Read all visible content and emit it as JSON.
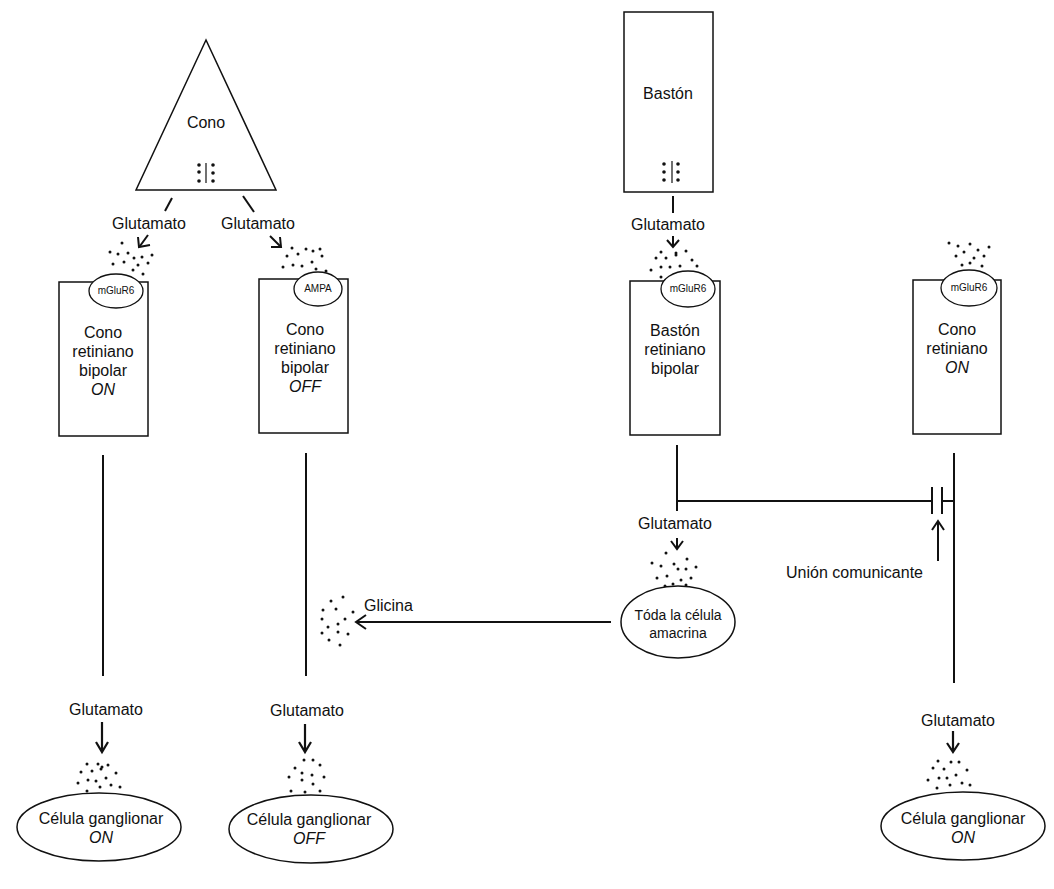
{
  "photoreceptors": {
    "cone": {
      "label": "Cono"
    },
    "rod": {
      "label": "Bastón"
    }
  },
  "neurotransmitters": {
    "glutamate": "Glutamato",
    "glycine": "Glicina"
  },
  "bipolar_cells": [
    {
      "receptor": "mGluR6",
      "line1": "Cono",
      "line2": "retiniano",
      "line3": "bipolar",
      "type": "ON"
    },
    {
      "receptor": "AMPA",
      "line1": "Cono",
      "line2": "retiniano",
      "line3": "bipolar",
      "type": "OFF"
    },
    {
      "receptor": "mGluR6",
      "line1": "Bastón",
      "line2": "retiniano",
      "line3": "bipolar",
      "type": ""
    },
    {
      "receptor": "mGluR6",
      "line1": "Cono",
      "line2": "retiniano",
      "line3": "",
      "type": "ON"
    }
  ],
  "amacrine": {
    "line1": "Tóda la célula",
    "line2": "amacrina"
  },
  "gap_junction": {
    "label": "Unión comunicante"
  },
  "ganglion_cells": [
    {
      "line1": "Célula ganglionar",
      "type": "ON"
    },
    {
      "line1": "Célula ganglionar",
      "type": "OFF"
    },
    {
      "line1": "Célula ganglionar",
      "type": "ON"
    }
  ]
}
